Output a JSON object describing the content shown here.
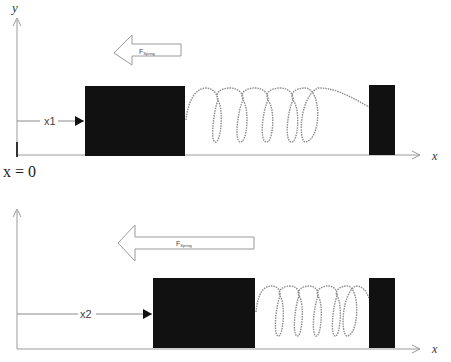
{
  "diagram": {
    "panels": [
      {
        "id": "top",
        "y_axis_label": "y",
        "x_axis_label": "x",
        "origin_label": "x = 0",
        "position_label": "x1",
        "force_label_main": "F",
        "force_label_sub": "Spring",
        "spring_loops": 5
      },
      {
        "id": "bottom",
        "x_axis_label": "x",
        "position_label": "x2",
        "force_label_main": "F",
        "force_label_sub": "Spring",
        "spring_loops": 5
      }
    ],
    "colors": {
      "block": "#111111",
      "axis": "#9a9a9a",
      "spring": "#8c8c8c",
      "background": "#ffffff"
    }
  }
}
